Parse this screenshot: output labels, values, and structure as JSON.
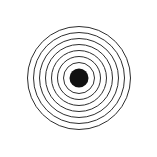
{
  "canvas": {
    "width": 157,
    "height": 157,
    "background_color": "#ffffff"
  },
  "figure": {
    "center_x": 79,
    "center_y": 78,
    "stroke_color": "#2e2e2e",
    "stroke_width": 1,
    "fill_color": "none",
    "ring_count": 7,
    "center_dot": {
      "name": "center-dot",
      "radius": 9.5,
      "fill_color": "#111111"
    },
    "rings": [
      {
        "name": "ring-1-innermost",
        "radius": 15.5
      },
      {
        "name": "ring-2",
        "radius": 21.5
      },
      {
        "name": "ring-3",
        "radius": 27.5
      },
      {
        "name": "ring-4",
        "radius": 33.5
      },
      {
        "name": "ring-5",
        "radius": 39.5
      },
      {
        "name": "ring-6",
        "radius": 45.5
      },
      {
        "name": "ring-7-outermost",
        "radius": 51.5
      }
    ]
  }
}
